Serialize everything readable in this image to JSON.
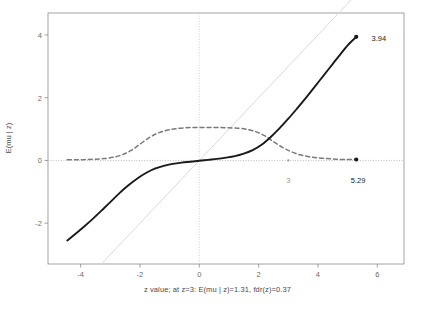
{
  "chart_data": {
    "type": "line",
    "title": "",
    "xlabel": "z value; at z=3: E(mu | z)=1.31, fdr(z)=0.37",
    "ylabel": "E(mu | z)",
    "xlim": [
      -5.1,
      6.9
    ],
    "ylim": [
      -3.3,
      4.7
    ],
    "xticks": [
      -4,
      -2,
      0,
      2,
      4,
      6
    ],
    "xtick_labels": [
      "-4",
      "-2",
      "0",
      "2",
      "4",
      "6"
    ],
    "yticks": [
      -2,
      0,
      2,
      4
    ],
    "ytick_labels": [
      "-2",
      "0",
      "2",
      "4"
    ],
    "grid": false,
    "legend": "none",
    "series": [
      {
        "name": "E(mu | z)",
        "style": "solid",
        "color": "#1a1a1a",
        "width": 1.9,
        "x": [
          -4.45,
          -4.2,
          -3.9,
          -3.6,
          -3.3,
          -3.0,
          -2.7,
          -2.4,
          -2.1,
          -1.8,
          -1.5,
          -1.2,
          -0.9,
          -0.6,
          -0.3,
          0.0,
          0.3,
          0.6,
          0.9,
          1.2,
          1.5,
          1.8,
          2.1,
          2.4,
          2.7,
          3.0,
          3.3,
          3.6,
          3.9,
          4.2,
          4.5,
          4.8,
          5.05,
          5.29
        ],
        "y": [
          -2.55,
          -2.36,
          -2.12,
          -1.87,
          -1.6,
          -1.33,
          -1.05,
          -0.8,
          -0.58,
          -0.4,
          -0.26,
          -0.17,
          -0.11,
          -0.07,
          -0.04,
          -0.01,
          0.02,
          0.05,
          0.09,
          0.14,
          0.22,
          0.33,
          0.5,
          0.74,
          1.02,
          1.33,
          1.66,
          2.0,
          2.36,
          2.72,
          3.08,
          3.44,
          3.72,
          3.94
        ]
      },
      {
        "name": "fdr(z)",
        "style": "dashed",
        "color": "#7a7a7a",
        "width": 1.5,
        "x": [
          -4.45,
          -4.1,
          -3.8,
          -3.5,
          -3.2,
          -2.9,
          -2.6,
          -2.3,
          -2.0,
          -1.7,
          -1.4,
          -1.1,
          -0.8,
          -0.5,
          -0.2,
          0.1,
          0.4,
          0.7,
          1.0,
          1.3,
          1.6,
          1.9,
          2.2,
          2.5,
          2.8,
          3.1,
          3.4,
          3.7,
          4.0,
          4.3,
          4.6,
          4.9,
          5.29
        ],
        "y": [
          0.02,
          0.02,
          0.03,
          0.04,
          0.06,
          0.1,
          0.18,
          0.32,
          0.52,
          0.72,
          0.87,
          0.96,
          1.01,
          1.04,
          1.05,
          1.05,
          1.05,
          1.05,
          1.04,
          1.03,
          0.99,
          0.92,
          0.79,
          0.6,
          0.42,
          0.28,
          0.18,
          0.12,
          0.08,
          0.06,
          0.04,
          0.03,
          0.03
        ]
      },
      {
        "name": "identity-reference-line",
        "style": "solid",
        "color": "#d5d5d5",
        "width": 0.9,
        "x": [
          -3.3,
          5.6
        ],
        "y": [
          -3.3,
          5.6
        ]
      }
    ],
    "reference_lines": [
      {
        "name": "zero-horizontal-line",
        "orientation": "horizontal",
        "value": 0,
        "style": "dotted",
        "color": "#b0b0b0"
      },
      {
        "name": "zero-vertical-line",
        "orientation": "vertical",
        "value": 0,
        "style": "dotted",
        "color": "#c8c8c8"
      }
    ],
    "points": [
      {
        "name": "curve-endpoint-upper",
        "x": 5.29,
        "y": 3.94,
        "color": "#1a1a1a",
        "radius": 2.1
      },
      {
        "name": "curve-endpoint-lower",
        "x": 5.29,
        "y": 0.03,
        "color": "#1a1a1a",
        "radius": 2.1
      },
      {
        "name": "z-three-marker",
        "x": 3.0,
        "y": 0.0,
        "color": "#9a9a9a",
        "radius": 1.1
      }
    ],
    "annotations": [
      {
        "name": "value-3-94",
        "text": "3.94",
        "x": 6.05,
        "y": 3.9,
        "color": "#1a1a1a"
      },
      {
        "name": "value-5-29",
        "text": "5.29",
        "x": 5.35,
        "y": -0.63,
        "color": "#1a1a1a"
      },
      {
        "name": "value-3",
        "text": "3",
        "x": 3.0,
        "y": -0.63,
        "color": "#9a9a9a"
      }
    ],
    "at_z": 3,
    "E_mu_given_z_at_3": 1.31,
    "fdr_at_3": 0.37,
    "max_E_mu": 3.94,
    "max_z": 5.29
  },
  "colors": {
    "background": "#ffffff",
    "axis": "#8c8c8c",
    "solid_curve": "#1a1a1a",
    "dashed_curve": "#7a7a7a",
    "reference_line": "#d5d5d5",
    "text": "#4a4a4a",
    "muted_text": "#9a9a9a"
  }
}
